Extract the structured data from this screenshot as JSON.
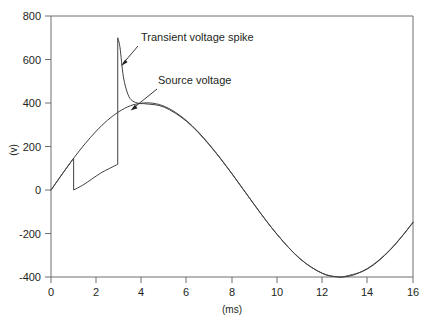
{
  "chart_data": {
    "type": "line",
    "title": "",
    "xlabel": "(ms)",
    "ylabel": "(v)",
    "xlim": [
      0,
      16
    ],
    "ylim": [
      -400,
      800
    ],
    "xticks": [
      0,
      2,
      4,
      6,
      8,
      10,
      12,
      14,
      16
    ],
    "yticks": [
      -400,
      -200,
      0,
      200,
      400,
      600,
      800
    ],
    "xtick_labels": [
      "0",
      "2",
      "4",
      "6",
      "8",
      "10",
      "12",
      "14",
      "16"
    ],
    "ytick_labels": [
      "-400",
      "-200",
      "0",
      "200",
      "400",
      "600",
      "800"
    ],
    "grid": false,
    "legend": "none",
    "annotations": [
      {
        "text": "Transient voltage spike",
        "text_x_px": 141,
        "text_y_px": 41,
        "leader_from_px": [
          138,
          46
        ],
        "leader_to_px": [
          121,
          65
        ]
      },
      {
        "text": "Source voltage",
        "text_x_px": 158,
        "text_y_px": 84,
        "leader_from_px": [
          157,
          89
        ],
        "leader_to_px": [
          131,
          110
        ]
      }
    ],
    "series": [
      {
        "name": "Source voltage",
        "description": "60 Hz sinusoid, amplitude 400 V, one full cycle over 16.67 ms",
        "amplitude": 400,
        "period_ms": 16.67,
        "x": [
          0,
          0.5,
          1,
          1.5,
          2,
          2.5,
          3,
          3.5,
          4,
          4.5,
          5,
          5.5,
          6,
          6.5,
          7,
          7.5,
          8,
          8.5,
          9,
          9.5,
          10,
          10.5,
          11,
          11.5,
          12,
          12.5,
          13,
          13.5,
          14,
          14.5,
          15,
          15.5,
          16
        ],
        "values": [
          0,
          74,
          146,
          212,
          271,
          321,
          360,
          387,
          399,
          399,
          385,
          357,
          318,
          268,
          209,
          144,
          75,
          3,
          -69,
          -140,
          -205,
          -264,
          -315,
          -355,
          -383,
          -398,
          -399,
          -386,
          -360,
          -322,
          -273,
          -214,
          -148
        ]
      },
      {
        "name": "Transient voltage spike",
        "description": "Follows source until 1 ms notch to 0 V, slow recovery, vertical spike to 700 V at 3.0 ms, decay rejoining source near 4 ms, then slightly lagging the source",
        "x": [
          0,
          0.5,
          1,
          1.0,
          1.4,
          1.8,
          2.2,
          2.6,
          2.95,
          2.95,
          3.05,
          3.2,
          3.4,
          3.6,
          3.9,
          4.2,
          5,
          6,
          7,
          8,
          9,
          10,
          11,
          12,
          12.6,
          13,
          14,
          15,
          16
        ],
        "values": [
          0,
          74,
          146,
          0,
          22,
          50,
          78,
          100,
          118,
          700,
          655,
          520,
          440,
          410,
          398,
          396,
          381,
          315,
          207,
          74,
          -70,
          -205,
          -316,
          -384,
          -398,
          -397,
          -362,
          -275,
          -150
        ]
      }
    ],
    "key_points": {
      "spike_peak_v": 700,
      "spike_peak_ms": 3.0,
      "notch_start_ms": 1.0,
      "notch_level_v": 0,
      "source_peak_v": 400,
      "source_peak_ms": 4.2,
      "source_trough_v": -400,
      "source_trough_ms": 12.5
    }
  },
  "axes": {
    "y_axis_title": "(v)",
    "x_axis_title": "(ms)"
  }
}
